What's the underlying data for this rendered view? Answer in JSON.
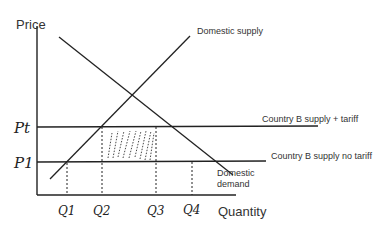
{
  "diagram": {
    "axes": {
      "y_label": "Price",
      "x_label": "Quantity"
    },
    "curves": {
      "domestic_supply": "Domestic supply",
      "domestic_demand_line1": "Domestic",
      "domestic_demand_line2": "demand",
      "supply_with_tariff": "Country B supply + tariff",
      "supply_no_tariff": "Country B supply no tariff"
    },
    "price_ticks": {
      "pt": "Pt",
      "p1": "P1"
    },
    "quantity_ticks": [
      "Q1",
      "Q2",
      "Q3",
      "Q4"
    ],
    "shaded_region": "tariff revenue area between Q2 and Q3, P1 and Pt",
    "colors": {
      "line": "#222222",
      "text": "#333333",
      "background": "#ffffff"
    }
  }
}
